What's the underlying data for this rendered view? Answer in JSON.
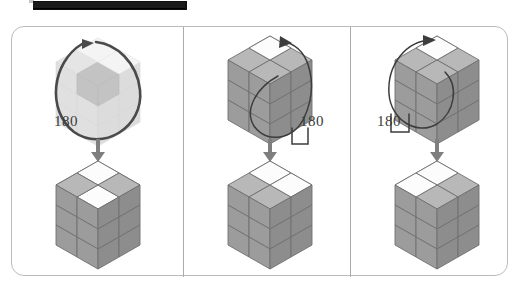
{
  "figure": {
    "title_bar": {
      "name": "redacted-caption-bar",
      "color": "#101010"
    },
    "frame": {
      "border_color": "#b9bcbe",
      "divider_color": "#a9acae",
      "background": "#ffffff"
    },
    "panel_count": 3,
    "row_labels": {
      "before": "before",
      "after": "after"
    },
    "flow_arrow": {
      "direction": "down",
      "color": "#7f7f7f"
    },
    "palette": {
      "cube_top": "#b3b3b3",
      "cube_left": "#9a9a9a",
      "cube_right": "#8c8c8c",
      "cube_edge": "#6f6f6f",
      "sticker_white": "#fdfdfd",
      "arrow_dark": "#4a4a4a",
      "ghost_fill": "#bdbdbd",
      "label_text": "#3a3a3a"
    },
    "panels": [
      {
        "id": "panel-1",
        "name": "panel-transparent-cube",
        "rotation_label": "180",
        "before": {
          "name": "cube-ghosted-xray",
          "style": "semi-transparent",
          "grid": 3,
          "rotation_axis": "vertical",
          "rotation_degrees": 180,
          "highlighted_cells": "center-column"
        },
        "after": {
          "name": "cube-solid",
          "style": "solid",
          "grid": 3,
          "white_stickers_top": 2,
          "sticker_positions": [
            "top-back-center",
            "top-mid-center"
          ]
        }
      },
      {
        "id": "panel-2",
        "name": "panel-solid-cube-right-loop",
        "rotation_label": "180",
        "before": {
          "name": "cube-solid",
          "style": "solid",
          "grid": 3,
          "white_stickers_top": 1,
          "sticker_positions": [
            "top-back-center"
          ],
          "loop_side": "right",
          "rotation_degrees": 180
        },
        "after": {
          "name": "cube-solid",
          "style": "solid",
          "grid": 3,
          "white_stickers_top": 2,
          "sticker_positions": [
            "top-back-center",
            "top-mid-right"
          ]
        }
      },
      {
        "id": "panel-3",
        "name": "panel-solid-cube-left-loop",
        "rotation_label": "180",
        "before": {
          "name": "cube-solid",
          "style": "solid",
          "grid": 3,
          "white_stickers_top": 1,
          "sticker_positions": [
            "top-back-center"
          ],
          "loop_side": "left",
          "rotation_degrees": 180
        },
        "after": {
          "name": "cube-solid",
          "style": "solid",
          "grid": 3,
          "white_stickers_top": 2,
          "sticker_positions": [
            "top-back-center",
            "top-mid-left"
          ]
        }
      }
    ]
  }
}
